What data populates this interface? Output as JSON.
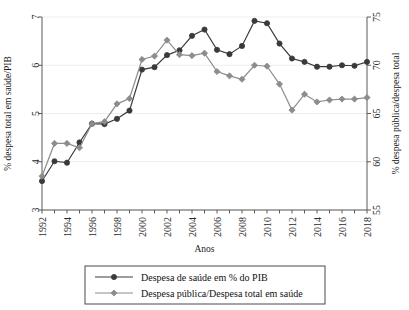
{
  "chart_data": {
    "type": "line",
    "title": "",
    "xlabel": "Anos",
    "ylabel": "% despesa total em saúde/PIB",
    "y2label": "% despesa pública/despesa total",
    "xlim": [
      1992,
      2018
    ],
    "ylim": [
      3,
      7
    ],
    "y2lim": [
      55,
      75
    ],
    "grid": true,
    "legend_position": "below-center",
    "xticks": [
      "1992",
      "1993",
      "1994",
      "1995",
      "1996",
      "1997",
      "1998",
      "1999",
      "2000",
      "2001",
      "2002",
      "2003",
      "2004",
      "2005",
      "2006",
      "2007",
      "2008",
      "2009",
      "2010",
      "2011",
      "2012",
      "2013",
      "2014",
      "2015",
      "2016",
      "2017",
      "2018"
    ],
    "xtick_labels_shown": [
      "1992",
      "1994",
      "1996",
      "1998",
      "2000",
      "2002",
      "2004",
      "2006",
      "2008",
      "2010",
      "2012",
      "2014",
      "2016",
      "2018"
    ],
    "yticks": [
      "3",
      "4",
      "5",
      "6",
      "7"
    ],
    "y2ticks": [
      "55",
      "60",
      "65",
      "70",
      "75"
    ],
    "x": [
      1992,
      1993,
      1994,
      1995,
      1996,
      1997,
      1998,
      1999,
      2000,
      2001,
      2002,
      2003,
      2004,
      2005,
      2006,
      2007,
      2008,
      2009,
      2010,
      2011,
      2012,
      2013,
      2014,
      2015,
      2016,
      2017,
      2018
    ],
    "series": [
      {
        "name": "Despesa de saúde em % do PIB",
        "axis": "left",
        "color": "#3a3a3a",
        "marker": "circle",
        "values": [
          3.6,
          4.01,
          3.98,
          4.4,
          4.79,
          4.78,
          4.89,
          5.06,
          5.91,
          5.96,
          6.21,
          6.31,
          6.61,
          6.74,
          6.32,
          6.23,
          6.4,
          6.92,
          6.87,
          6.45,
          6.14,
          6.07,
          5.97,
          5.97,
          6.0,
          5.99,
          6.07
        ]
      },
      {
        "name": "Despesa pública/Despesa total em saúde",
        "axis": "right",
        "color": "#8c8c8c",
        "marker": "diamond",
        "values": [
          58.5,
          61.9,
          61.9,
          61.45,
          63.95,
          64.15,
          66.0,
          66.55,
          70.6,
          70.95,
          72.6,
          71.1,
          71.0,
          71.25,
          69.35,
          68.9,
          68.55,
          70.0,
          69.9,
          68.05,
          65.35,
          67.0,
          66.2,
          66.4,
          66.5,
          66.5,
          66.65
        ]
      }
    ]
  },
  "legend": {
    "items": [
      {
        "label": "Despesa de saúde em % do PIB",
        "color": "#3a3a3a",
        "marker": "circle"
      },
      {
        "label": "Despesa pública/Despesa total em saúde",
        "color": "#8c8c8c",
        "marker": "diamond"
      }
    ]
  }
}
